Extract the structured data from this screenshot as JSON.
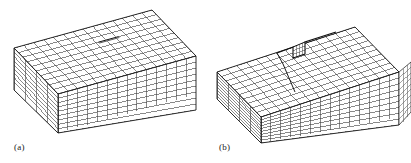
{
  "figure": {
    "background_color": "#ffffff",
    "line_color": "#333333",
    "accent_line_color": "#111111",
    "panel_count": 2
  },
  "panels": [
    {
      "id": "a",
      "caption": "(a)",
      "description": "Isometric lattice block with a cut (slit) on the top face before shear",
      "block": {
        "columns": 14,
        "rows": 10,
        "depth_layers": 8,
        "top_face": "parallelogram-grid",
        "front_face": "rectangular-grid",
        "side_face": "parallelogram-grid"
      },
      "feature": {
        "name": "slit-cut",
        "label": "",
        "position": "top face, center"
      }
    },
    {
      "id": "b",
      "caption": "(b)",
      "description": "Isometric lattice block after shear showing a one-cell step on the top face",
      "block": {
        "columns": 14,
        "rows": 10,
        "depth_layers": 8,
        "top_face": "parallelogram-grid",
        "front_face": "rectangular-grid",
        "side_face": "parallelogram-grid"
      },
      "feature": {
        "name": "shear-step",
        "label": "",
        "position": "top face, center-right raised one layer"
      }
    }
  ]
}
